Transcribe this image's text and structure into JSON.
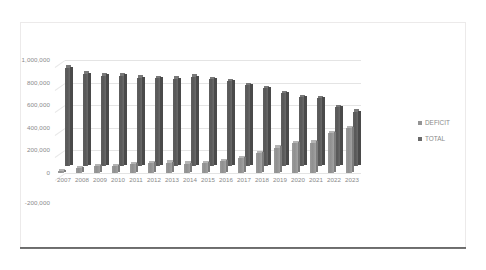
{
  "chart_data": {
    "type": "bar",
    "title": "",
    "subtitle": "",
    "xlabel": "",
    "ylabel": "",
    "grid": true,
    "legend_position": "right",
    "three_d": true,
    "categories": [
      "2007",
      "2008",
      "2009",
      "2010",
      "2011",
      "2012",
      "2013",
      "2014",
      "2015",
      "2016",
      "2017",
      "2018",
      "2019",
      "2020",
      "2021",
      "2022",
      "2023"
    ],
    "ylim": [
      -200000,
      1000000
    ],
    "ytick_labels": [
      "1,000,000",
      "800,000",
      "600,000",
      "400,000",
      "200,000",
      "0",
      "-200,000"
    ],
    "ytick_values": [
      1000000,
      800000,
      600000,
      400000,
      200000,
      0,
      -200000
    ],
    "series": [
      {
        "name": "DEFICIT",
        "color": "#949494",
        "values": [
          15000,
          42000,
          60000,
          58000,
          78000,
          85000,
          90000,
          80000,
          88000,
          105000,
          130000,
          175000,
          225000,
          265000,
          270000,
          350000,
          395000
        ]
      },
      {
        "name": "TOTAL",
        "color": "#5d5d5d",
        "values": [
          870000,
          815000,
          800000,
          800000,
          780000,
          778000,
          772000,
          790000,
          768000,
          752000,
          715000,
          690000,
          645000,
          610000,
          600000,
          520000,
          480000
        ]
      }
    ]
  },
  "legend": {
    "items": [
      {
        "label": "DEFICIT",
        "color": "#949494"
      },
      {
        "label": "TOTAL",
        "color": "#6a6a6a"
      }
    ]
  }
}
